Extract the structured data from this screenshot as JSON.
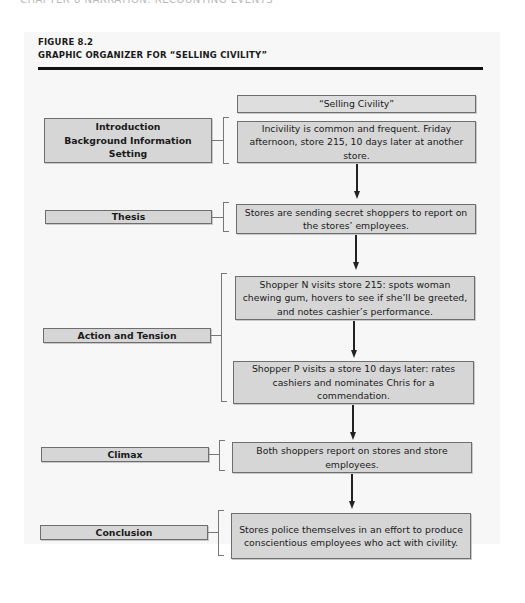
{
  "page": {
    "running_head": "CHAPTER 8   NARRATION: RECOUNTING EVENTS"
  },
  "figure": {
    "number": "FIGURE 8.2",
    "title": "GRAPHIC ORGANIZER FOR “SELLING CIVILITY”"
  },
  "organizer": {
    "essay_title": "“Selling Civility”",
    "sections": [
      {
        "label": "Introduction\nBackground Information\nSetting",
        "label_lines": [
          "Introduction",
          "Background Information",
          "Setting"
        ],
        "content": [
          "Incivility is common and frequent. Friday afternoon, store 215, 10 days later at another store."
        ]
      },
      {
        "label": "Thesis",
        "content": [
          "Stores are sending secret shoppers to report on the stores’ employees."
        ]
      },
      {
        "label": "Action and Tension",
        "content": [
          "Shopper N visits store 215: spots woman chewing gum, hovers to see if she’ll be greeted, and notes cashier’s performance.",
          "Shopper P visits a store 10 days later: rates cashiers and nominates Chris for a commendation."
        ]
      },
      {
        "label": "Climax",
        "content": [
          "Both shoppers report on stores and store employees."
        ]
      },
      {
        "label": "Conclusion",
        "content": [
          "Stores police themselves in an effort to produce conscientious employees who act with civility."
        ]
      }
    ]
  },
  "colors": {
    "box_fill": "#d6d6d6",
    "box_border": "#6e6e6e",
    "panel_bg": "#f7f7f7",
    "rule": "#111111"
  }
}
